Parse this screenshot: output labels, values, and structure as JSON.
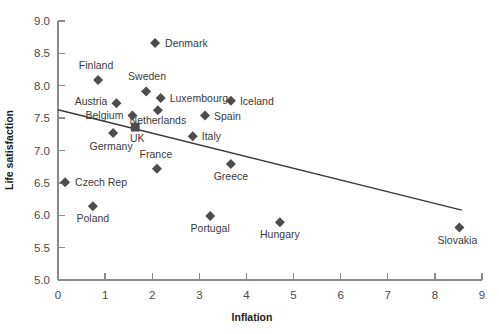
{
  "chart_data": {
    "type": "scatter",
    "title": "",
    "xlabel": "Inflation",
    "ylabel": "Life satisfaction",
    "xlim": [
      0,
      9
    ],
    "ylim": [
      5.0,
      9.0
    ],
    "xticks": [
      "0",
      "1",
      "2",
      "3",
      "4",
      "5",
      "6",
      "7",
      "8",
      "9"
    ],
    "yticks": [
      "5.0",
      "5.5",
      "6.0",
      "6.5",
      "7.0",
      "7.5",
      "8.0",
      "8.5",
      "9.0"
    ],
    "grid": false,
    "legend": "none",
    "marker_shape": "diamond",
    "marker_color": "#4d4d4d",
    "trendline": {
      "name": "linear fit",
      "x0": 0.0,
      "y0": 7.63,
      "x1": 8.57,
      "y1": 6.08,
      "color": "#3a3a3a"
    },
    "points": [
      {
        "label": "Denmark",
        "x": 2.06,
        "y": 8.66,
        "label_dx": 10,
        "label_dy": 4,
        "anchor": "start",
        "marker": "diamond"
      },
      {
        "label": "Finland",
        "x": 0.85,
        "y": 8.09,
        "label_dx": -2,
        "label_dy": -11,
        "anchor": "middle",
        "marker": "diamond"
      },
      {
        "label": "Sweden",
        "x": 1.87,
        "y": 7.91,
        "label_dx": 1,
        "label_dy": -12,
        "anchor": "middle",
        "marker": "diamond"
      },
      {
        "label": "Luxembourg",
        "x": 2.18,
        "y": 7.81,
        "label_dx": 9,
        "label_dy": 4,
        "anchor": "start",
        "marker": "diamond"
      },
      {
        "label": "Iceland",
        "x": 3.67,
        "y": 7.77,
        "label_dx": 9,
        "label_dy": 4,
        "anchor": "start",
        "marker": "diamond"
      },
      {
        "label": "Austria",
        "x": 1.24,
        "y": 7.73,
        "label_dx": -9,
        "label_dy": 2,
        "anchor": "end",
        "marker": "diamond"
      },
      {
        "label": "Netherlands",
        "x": 2.12,
        "y": 7.62,
        "label_dx": 0,
        "label_dy": 14,
        "anchor": "middle",
        "marker": "diamond"
      },
      {
        "label": "Spain",
        "x": 3.12,
        "y": 7.54,
        "label_dx": 9,
        "label_dy": 4,
        "anchor": "start",
        "marker": "diamond"
      },
      {
        "label": "Belgium",
        "x": 1.58,
        "y": 7.54,
        "label_dx": -9,
        "label_dy": 3,
        "anchor": "end",
        "marker": "diamond"
      },
      {
        "label": "UK",
        "x": 1.64,
        "y": 7.36,
        "label_dx": 2,
        "label_dy": 15,
        "anchor": "middle",
        "marker": "square"
      },
      {
        "label": "Italy",
        "x": 2.86,
        "y": 7.22,
        "label_dx": 9,
        "label_dy": 4,
        "anchor": "start",
        "marker": "diamond"
      },
      {
        "label": "Germany",
        "x": 1.17,
        "y": 7.27,
        "label_dx": -2,
        "label_dy": 17,
        "anchor": "middle",
        "marker": "diamond"
      },
      {
        "label": "Greece",
        "x": 3.67,
        "y": 6.79,
        "label_dx": 0,
        "label_dy": 16,
        "anchor": "middle",
        "marker": "diamond"
      },
      {
        "label": "France",
        "x": 2.1,
        "y": 6.72,
        "label_dx": -1,
        "label_dy": -11,
        "anchor": "middle",
        "marker": "diamond"
      },
      {
        "label": "Czech Rep",
        "x": 0.15,
        "y": 6.51,
        "label_dx": 10,
        "label_dy": 4,
        "anchor": "start",
        "marker": "diamond"
      },
      {
        "label": "Poland",
        "x": 0.74,
        "y": 6.14,
        "label_dx": 0,
        "label_dy": 16,
        "anchor": "middle",
        "marker": "diamond"
      },
      {
        "label": "Portugal",
        "x": 3.23,
        "y": 5.99,
        "label_dx": 0,
        "label_dy": 16,
        "anchor": "middle",
        "marker": "diamond"
      },
      {
        "label": "Hungary",
        "x": 4.71,
        "y": 5.89,
        "label_dx": 0,
        "label_dy": 16,
        "anchor": "middle",
        "marker": "diamond"
      },
      {
        "label": "Slovakia",
        "x": 8.52,
        "y": 5.81,
        "label_dx": -2,
        "label_dy": 16,
        "anchor": "middle",
        "marker": "diamond"
      }
    ]
  },
  "geometry": {
    "plot_left": 58,
    "plot_right": 482,
    "plot_bottom": 280,
    "plot_top": 21,
    "x_min": 0,
    "x_max": 9,
    "y_min": 5.0,
    "y_max": 9.0,
    "marker_half": 5.0,
    "ylabel_x": 13,
    "ylabel_y": 150,
    "xlabel_x": 252,
    "xlabel_y": 321
  }
}
